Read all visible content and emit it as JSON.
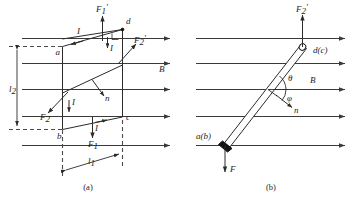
{
  "figure": {
    "colors": {
      "field_line": "#3a3a3a",
      "loop_line": "#2b2b2b",
      "dashed_guide": "#4a4a4a",
      "ink": "#1c1c1c",
      "background": "#ffffff"
    },
    "panels": [
      {
        "id": "a",
        "caption": "(a)",
        "field_label": "B",
        "field_line_count": 5,
        "vertices": [
          {
            "name": "a",
            "label": "a"
          },
          {
            "name": "b",
            "label": "b"
          },
          {
            "name": "c",
            "label": "c"
          },
          {
            "name": "d",
            "label": "d"
          }
        ],
        "current_labels": [
          {
            "name": "current-top",
            "label": "I"
          },
          {
            "name": "current-right",
            "label": "I"
          },
          {
            "name": "current-left",
            "label": "I"
          },
          {
            "name": "current-bottom",
            "label": "I"
          }
        ],
        "forces": [
          {
            "name": "F1-prime",
            "base": "F",
            "sub": "1",
            "prime": "′",
            "direction": "up"
          },
          {
            "name": "F2-prime",
            "base": "F",
            "sub": "2",
            "prime": "′",
            "direction": "up-right"
          },
          {
            "name": "F2",
            "base": "F",
            "sub": "2",
            "prime": "",
            "direction": "down-left"
          },
          {
            "name": "F1",
            "base": "F",
            "sub": "1",
            "prime": "",
            "direction": "down"
          }
        ],
        "normal_label": "n",
        "dimensions": [
          {
            "name": "length-l1",
            "base": "l",
            "sub": "1",
            "orientation": "horizontal"
          },
          {
            "name": "length-l2",
            "base": "l",
            "sub": "2",
            "orientation": "vertical"
          }
        ],
        "right_angle_marker": true
      },
      {
        "id": "b",
        "caption": "(b)",
        "field_label": "B",
        "field_line_count": 5,
        "vertices": [
          {
            "name": "end-near",
            "label": "a(b)"
          },
          {
            "name": "end-far",
            "label": "d(c)"
          }
        ],
        "angles": [
          {
            "name": "theta",
            "label": "θ"
          },
          {
            "name": "phi",
            "label": "φ"
          }
        ],
        "normal_label": "n",
        "forces": [
          {
            "name": "F2-prime",
            "base": "F",
            "sub": "2",
            "prime": "′",
            "direction": "up"
          },
          {
            "name": "F",
            "base": "F",
            "sub": "",
            "prime": "",
            "direction": "down"
          }
        ]
      }
    ]
  }
}
